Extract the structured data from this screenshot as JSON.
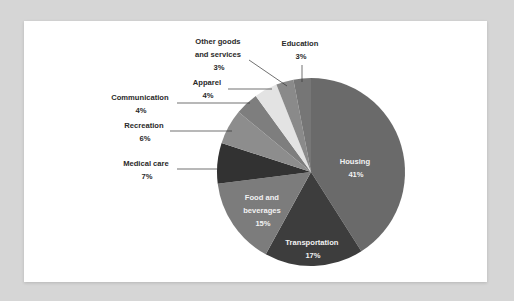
{
  "chart_data": {
    "type": "pie",
    "title": "",
    "start_angle_deg": 0,
    "direction": "clockwise",
    "slices": [
      {
        "label": "Housing",
        "value": 41,
        "pct_label": "41%",
        "color": "#6a6a6a",
        "label_inside": true
      },
      {
        "label": "Transportation",
        "value": 17,
        "pct_label": "17%",
        "color": "#3d3d3d",
        "label_inside": true
      },
      {
        "label": "Food and beverages",
        "value": 15,
        "pct_label": "15%",
        "color": "#7c7c7c",
        "label_inside": true
      },
      {
        "label": "Medical care",
        "value": 7,
        "pct_label": "7%",
        "color": "#323232",
        "label_inside": false
      },
      {
        "label": "Recreation",
        "value": 6,
        "pct_label": "6%",
        "color": "#8d8d8d",
        "label_inside": false
      },
      {
        "label": "Communication",
        "value": 4,
        "pct_label": "4%",
        "color": "#7e7e7e",
        "label_inside": false
      },
      {
        "label": "Apparel",
        "value": 4,
        "pct_label": "4%",
        "color": "#e3e3e3",
        "label_inside": false
      },
      {
        "label": "Other goods and services",
        "value": 3,
        "pct_label": "3%",
        "color": "#8a8a8a",
        "label_inside": false
      },
      {
        "label": "Education",
        "value": 3,
        "pct_label": "3%",
        "color": "#767676",
        "label_inside": false
      }
    ],
    "legend": "none (direct labels)"
  },
  "labels": {
    "housing": {
      "line1": "Housing",
      "pct": "41%"
    },
    "transportation": {
      "line1": "Transportation",
      "pct": "17%"
    },
    "food": {
      "line1": "Food and",
      "line2": "beverages",
      "pct": "15%"
    },
    "medical": {
      "line1": "Medical care",
      "pct": "7%"
    },
    "recreation": {
      "line1": "Recreation",
      "pct": "6%"
    },
    "communication": {
      "line1": "Communication",
      "pct": "4%"
    },
    "apparel": {
      "line1": "Apparel",
      "pct": "4%"
    },
    "other": {
      "line1": "Other goods",
      "line2": "and services",
      "pct": "3%"
    },
    "education": {
      "line1": "Education",
      "pct": "3%"
    }
  }
}
